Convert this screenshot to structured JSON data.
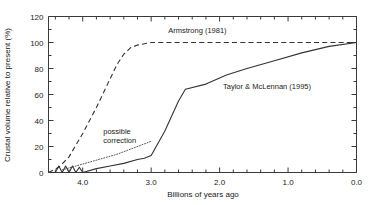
{
  "chart_data": {
    "type": "line",
    "title": "",
    "xlabel": "Billions of years ago",
    "ylabel": "Crustal volume relative to present (%)",
    "xlim": [
      4.5,
      0.0
    ],
    "ylim": [
      0,
      120
    ],
    "x_reversed": true,
    "grid": false,
    "legend": "inline-annotations",
    "xticklabels": [
      "4.0",
      "3.0",
      "2.0",
      "1.0",
      "0.0"
    ],
    "xtickvalues": [
      4.0,
      3.0,
      2.0,
      1.0,
      0.0
    ],
    "xminor_step": 0.2,
    "yticklabels": [
      "0",
      "20",
      "40",
      "60",
      "80",
      "100",
      "120"
    ],
    "ytickvalues": [
      0,
      20,
      40,
      60,
      80,
      100,
      120
    ],
    "series": [
      {
        "name": "Armstrong (1981)",
        "style": "dashed",
        "label_text": "Armstrong (1981)",
        "x": [
          4.5,
          4.35,
          4.2,
          4.0,
          3.8,
          3.6,
          3.5,
          3.4,
          3.3,
          3.2,
          3.0,
          2.5,
          2.0,
          1.5,
          1.0,
          0.5,
          0.0
        ],
        "y": [
          0,
          4,
          12,
          30,
          50,
          72,
          83,
          91,
          96,
          98,
          100,
          100,
          100,
          100,
          100,
          100,
          100
        ]
      },
      {
        "name": "Taylor & McLennan (1995)",
        "style": "solid",
        "label_text": "Taylor & McLennan (1995)",
        "x": [
          4.5,
          4.4,
          4.35,
          4.3,
          4.25,
          4.2,
          4.15,
          4.1,
          4.05,
          4.0,
          3.8,
          3.6,
          3.4,
          3.2,
          3.1,
          3.0,
          2.8,
          2.6,
          2.5,
          2.2,
          1.9,
          1.6,
          1.2,
          0.8,
          0.4,
          0.0
        ],
        "y": [
          0,
          0,
          5,
          0,
          5,
          0,
          5,
          0,
          4,
          0,
          3,
          5,
          7,
          10,
          11,
          13,
          32,
          55,
          64,
          68,
          75,
          80,
          86,
          92,
          97,
          100
        ]
      },
      {
        "name": "possible correction",
        "style": "dotted",
        "label_text": "possible correction",
        "x": [
          4.3,
          4.1,
          3.9,
          3.7,
          3.5,
          3.3,
          3.1,
          3.0
        ],
        "y": [
          2,
          5,
          8,
          11,
          14,
          18,
          22,
          24
        ]
      }
    ],
    "annotations": [
      {
        "text": "Armstrong (1981)",
        "x": 2.75,
        "y": 107,
        "name": "armstrong-label"
      },
      {
        "text": "Taylor & McLennan (1995)",
        "x": 1.95,
        "y": 64,
        "name": "taylor-mclennan-label"
      },
      {
        "text": "possible",
        "x": 3.7,
        "y": 30,
        "name": "possible-correction-label-line1"
      },
      {
        "text": "correction",
        "x": 3.7,
        "y": 23,
        "name": "possible-correction-label-line2"
      }
    ]
  }
}
